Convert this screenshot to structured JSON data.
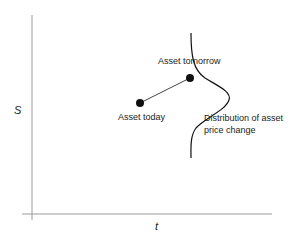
{
  "axes": {
    "y_label": "S",
    "x_label": "t"
  },
  "points": [
    {
      "label": "Asset today",
      "x": 140,
      "y": 103
    },
    {
      "label": "Asset tomorrow",
      "x": 190,
      "y": 78
    }
  ],
  "distribution": {
    "label_line1": "Distribution of asset",
    "label_line2": "price change"
  },
  "colors": {
    "axis": "#999999",
    "ink": "#111111"
  }
}
